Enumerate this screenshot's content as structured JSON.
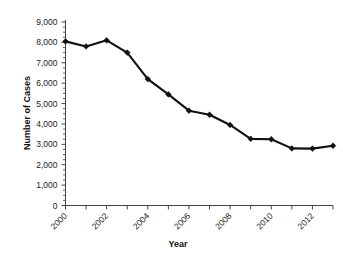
{
  "chart_data": {
    "type": "line",
    "title": "",
    "xlabel": "Year",
    "ylabel": "Number of Cases",
    "x": [
      2000,
      2001,
      2002,
      2003,
      2004,
      2005,
      2006,
      2007,
      2008,
      2009,
      2010,
      2011,
      2012,
      2013
    ],
    "values": [
      8050,
      7800,
      8100,
      7500,
      6200,
      5450,
      4650,
      4450,
      3950,
      3270,
      3250,
      2800,
      2790,
      2930
    ],
    "series": [
      {
        "name": "Number of Cases",
        "values": [
          8050,
          7800,
          8100,
          7500,
          6200,
          5450,
          4650,
          4450,
          3950,
          3270,
          3250,
          2800,
          2790,
          2930
        ]
      }
    ],
    "categories": [
      "2000",
      "2001",
      "2002",
      "2003",
      "2004",
      "2005",
      "2006",
      "2007",
      "2008",
      "2009",
      "2010",
      "2011",
      "2012",
      "2013"
    ],
    "xlim": [
      2000,
      2013
    ],
    "ylim": [
      0,
      9000
    ],
    "ytick_values": [
      0,
      1000,
      2000,
      3000,
      4000,
      5000,
      6000,
      7000,
      8000,
      9000
    ],
    "ytick_labels": [
      "0",
      "1,000",
      "2,000",
      "3,000",
      "4,000",
      "5,000",
      "6,000",
      "7,000",
      "8,000",
      "9,000"
    ],
    "xtick_values": [
      2000,
      2001,
      2002,
      2003,
      2004,
      2005,
      2006,
      2007,
      2008,
      2009,
      2010,
      2011,
      2012,
      2013
    ],
    "xtick_labels_shown": [
      "2000",
      "2002",
      "2004",
      "2006",
      "2008",
      "2010",
      "2012"
    ],
    "xtick_label_rotation": 45,
    "y_minor_tick_interval": 250,
    "grid": false,
    "legend": false,
    "legend_position": "none",
    "marker": "diamond",
    "line_color": "#111111",
    "marker_color": "#111111",
    "background_color": "#ffffff",
    "axis_color": "#444444"
  }
}
